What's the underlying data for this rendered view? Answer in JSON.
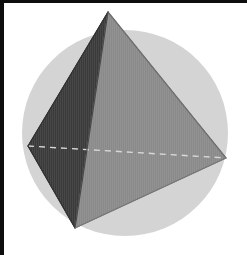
{
  "figure": {
    "title": "Tetrahedron inscribed in circle",
    "canvas": {
      "width": 247,
      "height": 255,
      "background": "#ffffff"
    },
    "border": {
      "color": "#0d0d0d",
      "left_width": 4,
      "top_width": 3
    },
    "circle": {
      "label": "circumscribing circle",
      "cx": 125,
      "cy": 133,
      "r": 103,
      "fill": "#d4d4d4"
    },
    "vertices": [
      {
        "name": "apex",
        "x": 108,
        "y": 12
      },
      {
        "name": "left",
        "x": 28,
        "y": 146
      },
      {
        "name": "right",
        "x": 226,
        "y": 158
      },
      {
        "name": "bottom",
        "x": 75,
        "y": 228
      }
    ],
    "faces": [
      {
        "name": "left-face",
        "points": "108,12 28,146 75,228",
        "fill": "#3a3a3a",
        "stroke": "#2a2a2a"
      },
      {
        "name": "right-face",
        "points": "108,12 226,158 75,228",
        "fill": "#8a8a8a",
        "stroke": "#7b7b7b"
      }
    ],
    "edges": [
      {
        "name": "apex-to-left",
        "x1": 108,
        "y1": 12,
        "x2": 28,
        "y2": 146,
        "stroke": "#333333",
        "width": 1.2
      },
      {
        "name": "apex-to-right",
        "x1": 108,
        "y1": 12,
        "x2": 226,
        "y2": 158,
        "stroke": "#6f6f6f",
        "width": 1.2
      },
      {
        "name": "apex-to-bottom",
        "x1": 108,
        "y1": 12,
        "x2": 75,
        "y2": 228,
        "stroke": "#4a4a4a",
        "width": 1.2
      },
      {
        "name": "left-to-bottom",
        "x1": 28,
        "y1": 146,
        "x2": 75,
        "y2": 228,
        "stroke": "#333333",
        "width": 1.2
      },
      {
        "name": "right-to-bottom",
        "x1": 226,
        "y1": 158,
        "x2": 75,
        "y2": 228,
        "stroke": "#777777",
        "width": 1.2
      }
    ],
    "hidden_edge": {
      "name": "left-to-right-hidden",
      "x1": 28,
      "y1": 146,
      "x2": 226,
      "y2": 158,
      "stroke": "#d8d8d8",
      "width": 1.4,
      "dash": "6 5"
    },
    "texture": {
      "name": "vertical-stripes",
      "spacing": 2,
      "opacity": 0.07,
      "color": "#ffffff"
    }
  }
}
